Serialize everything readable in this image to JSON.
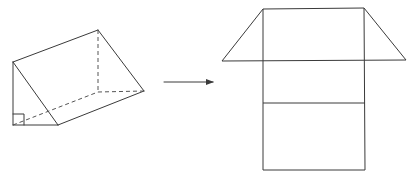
{
  "diagram": {
    "description": "Right triangular prism and its unfolded net",
    "stroke_color": "#3a3a3a",
    "background": "#ffffff",
    "prism": {
      "name": "triangular-prism",
      "vertices": {
        "A_left_top": [
          13,
          62
        ],
        "B_left_bottom": [
          13,
          125
        ],
        "C_front_right": [
          58,
          125
        ],
        "D_back_top": [
          98,
          30
        ],
        "E_back_bottom": [
          98,
          92
        ],
        "F_back_right": [
          144,
          91
        ]
      },
      "right_angle_marker": true
    },
    "arrow": {
      "from": [
        164,
        82
      ],
      "to": [
        214,
        82
      ],
      "meaning": "unfolds to"
    },
    "net": {
      "name": "prism-net",
      "rectangle": {
        "left": 263,
        "right": 365,
        "top": 9,
        "bottom": 170
      },
      "fold_lines_y": [
        61,
        103
      ],
      "left_triangle": [
        [
          222,
          61
        ],
        [
          263,
          9
        ],
        [
          263,
          61
        ]
      ],
      "right_triangle": [
        [
          364,
          9
        ],
        [
          406,
          60
        ],
        [
          364,
          60
        ]
      ]
    }
  }
}
